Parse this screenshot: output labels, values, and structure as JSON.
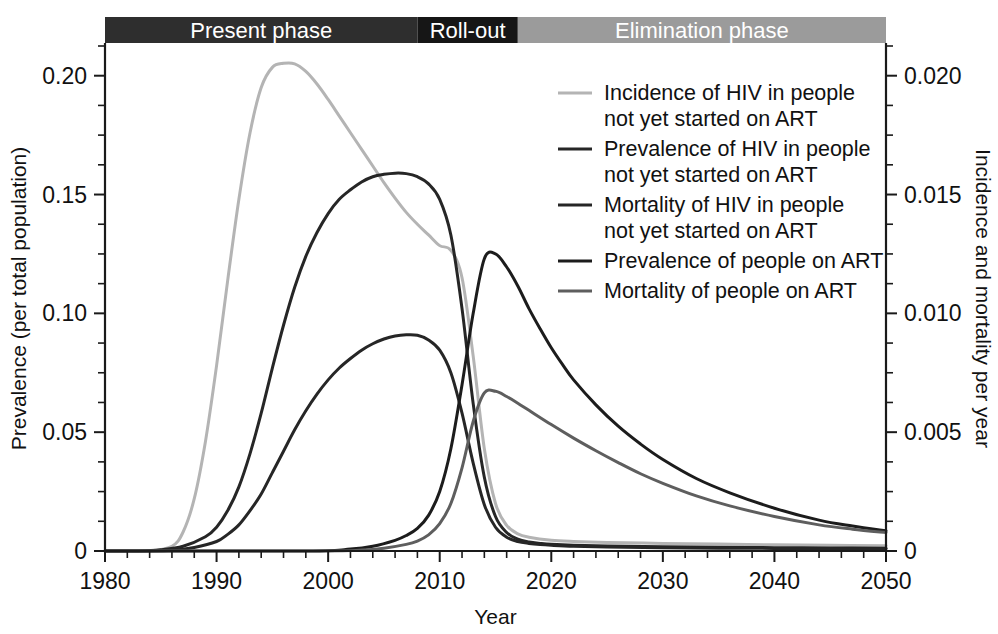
{
  "chart_data": {
    "type": "line",
    "title": "",
    "xlabel": "Year",
    "ylabel": "Prevalence (per total population)",
    "y2label": "Incidence and mortality per year",
    "xlim": [
      1980,
      2050
    ],
    "ylim": [
      0,
      0.2125
    ],
    "y2lim": [
      0,
      0.02125
    ],
    "grid": false,
    "legend_position": "inside-upper-right",
    "x_ticks": [
      "1980",
      "1990",
      "2000",
      "2010",
      "2020",
      "2030",
      "2040",
      "2050"
    ],
    "x_tick_values": [
      1980,
      1990,
      2000,
      2010,
      2020,
      2030,
      2040,
      2050
    ],
    "x_minor_step": 2,
    "y_ticks": [
      "0",
      "0.05",
      "0.10",
      "0.15",
      "0.20"
    ],
    "y_tick_values": [
      0,
      0.05,
      0.1,
      0.15,
      0.2
    ],
    "y_minor_step": 0.0125,
    "y2_ticks": [
      "0",
      "0.005",
      "0.010",
      "0.015",
      "0.020"
    ],
    "y2_tick_values": [
      0,
      0.005,
      0.01,
      0.015,
      0.02
    ],
    "y2_minor_step": 0.00125,
    "phase_bands": [
      {
        "label": "Present phase",
        "start": 1980,
        "end": 2008,
        "color": "#2e2e2e"
      },
      {
        "label": "Roll-out",
        "start": 2008,
        "end": 2017,
        "color": "#161616"
      },
      {
        "label": "Elimination phase",
        "start": 2017,
        "end": 2050,
        "color": "#9b9b9b"
      }
    ],
    "series": [
      {
        "name": "Incidence of HIV in people not yet started on ART",
        "legend_label_line1": "Incidence of HIV in people",
        "legend_label_line2": "not yet started on ART",
        "axis": "right",
        "color": "#b4b4b4",
        "width": 3.0,
        "x": [
          1980,
          1982,
          1984,
          1986,
          1987,
          1988,
          1989,
          1990,
          1991,
          1992,
          1993,
          1994,
          1995,
          1996,
          1997,
          1998,
          1999,
          2000,
          2001,
          2002,
          2003,
          2004,
          2005,
          2006,
          2007,
          2008,
          2009,
          2010,
          2011,
          2012,
          2013,
          2014,
          2015,
          2016,
          2017,
          2018,
          2020,
          2022,
          2025,
          2030,
          2035,
          2040,
          2045,
          2050
        ],
        "y_left_scale": [
          0.0,
          0.0,
          0.0,
          0.002,
          0.008,
          0.022,
          0.046,
          0.078,
          0.114,
          0.148,
          0.176,
          0.195,
          0.2035,
          0.2052,
          0.205,
          0.2018,
          0.1965,
          0.19,
          0.183,
          0.176,
          0.169,
          0.162,
          0.155,
          0.1485,
          0.1425,
          0.1375,
          0.133,
          0.1285,
          0.1265,
          0.115,
          0.082,
          0.043,
          0.02,
          0.0108,
          0.0072,
          0.0058,
          0.0045,
          0.004,
          0.0036,
          0.0032,
          0.0029,
          0.0026,
          0.0024,
          0.0022
        ]
      },
      {
        "name": "Prevalence of HIV in people not yet started on ART",
        "legend_label_line1": "Prevalence of HIV in people",
        "legend_label_line2": "not yet started on ART",
        "axis": "left",
        "color": "#262626",
        "width": 3.0,
        "x": [
          1980,
          1983,
          1985,
          1987,
          1989,
          1990,
          1991,
          1992,
          1993,
          1994,
          1995,
          1996,
          1997,
          1998,
          1999,
          2000,
          2001,
          2002,
          2003,
          2004,
          2005,
          2006,
          2007,
          2008,
          2009,
          2010,
          2011,
          2012,
          2013,
          2014,
          2015,
          2016,
          2017,
          2018,
          2019,
          2020,
          2022,
          2025,
          2030,
          2035,
          2040,
          2045,
          2050
        ],
        "y_left_scale": [
          0.0,
          0.0,
          0.0005,
          0.002,
          0.006,
          0.01,
          0.017,
          0.027,
          0.041,
          0.058,
          0.077,
          0.095,
          0.111,
          0.124,
          0.134,
          0.142,
          0.148,
          0.152,
          0.1553,
          0.1575,
          0.1585,
          0.159,
          0.1588,
          0.1575,
          0.1545,
          0.148,
          0.133,
          0.102,
          0.062,
          0.031,
          0.0145,
          0.0078,
          0.005,
          0.0038,
          0.0032,
          0.0028,
          0.0024,
          0.0021,
          0.0018,
          0.0016,
          0.0014,
          0.0013,
          0.0012
        ]
      },
      {
        "name": "Mortality of HIV in people not yet started on ART",
        "legend_label_line1": "Mortality of HIV in people",
        "legend_label_line2": "not yet started on ART",
        "axis": "right",
        "color": "#262626",
        "width": 3.0,
        "x": [
          1980,
          1984,
          1986,
          1988,
          1990,
          1991,
          1992,
          1993,
          1994,
          1995,
          1996,
          1997,
          1998,
          1999,
          2000,
          2001,
          2002,
          2003,
          2004,
          2005,
          2006,
          2007,
          2008,
          2009,
          2010,
          2011,
          2012,
          2013,
          2014,
          2015,
          2016,
          2017,
          2018,
          2019,
          2020,
          2022,
          2025,
          2030,
          2035,
          2040,
          2045,
          2050
        ],
        "y_left_scale": [
          0.0,
          0.0,
          0.0003,
          0.0015,
          0.004,
          0.007,
          0.011,
          0.017,
          0.024,
          0.033,
          0.042,
          0.051,
          0.059,
          0.066,
          0.072,
          0.077,
          0.081,
          0.0845,
          0.0872,
          0.0892,
          0.0905,
          0.091,
          0.0908,
          0.0888,
          0.0845,
          0.075,
          0.058,
          0.037,
          0.0195,
          0.01,
          0.0058,
          0.004,
          0.0032,
          0.0027,
          0.0024,
          0.002,
          0.0017,
          0.0014,
          0.0012,
          0.0011,
          0.001,
          0.0009
        ]
      },
      {
        "name": "Prevalence of people on ART",
        "legend_label_line1": "Prevalence of people on ART",
        "legend_label_line2": "",
        "axis": "left",
        "color": "#1c1c1c",
        "width": 3.0,
        "x": [
          1980,
          1998,
          2002,
          2004,
          2006,
          2007,
          2008,
          2009,
          2010,
          2011,
          2012,
          2013,
          2014,
          2015,
          2016,
          2017,
          2018,
          2019,
          2020,
          2021,
          2022,
          2024,
          2026,
          2028,
          2030,
          2033,
          2036,
          2040,
          2044,
          2047,
          2050
        ],
        "y_left_scale": [
          0.0,
          0.0,
          0.0008,
          0.002,
          0.0045,
          0.0065,
          0.0095,
          0.015,
          0.025,
          0.043,
          0.07,
          0.1,
          0.123,
          0.125,
          0.1195,
          0.1115,
          0.102,
          0.0935,
          0.0855,
          0.0785,
          0.072,
          0.0615,
          0.0525,
          0.045,
          0.0385,
          0.0305,
          0.0245,
          0.018,
          0.013,
          0.0105,
          0.0085
        ]
      },
      {
        "name": "Mortality of people on ART",
        "legend_label_line1": "Mortality of people on ART",
        "legend_label_line2": "",
        "axis": "right",
        "color": "#5e5e5e",
        "width": 3.0,
        "x": [
          1980,
          1999,
          2003,
          2005,
          2007,
          2008,
          2009,
          2010,
          2011,
          2012,
          2013,
          2014,
          2015,
          2016,
          2017,
          2018,
          2020,
          2022,
          2024,
          2026,
          2028,
          2030,
          2033,
          2036,
          2040,
          2044,
          2047,
          2050
        ],
        "y_left_scale": [
          0.0,
          0.0,
          0.0004,
          0.0012,
          0.0028,
          0.0042,
          0.0068,
          0.0115,
          0.02,
          0.035,
          0.0545,
          0.0665,
          0.0672,
          0.065,
          0.0622,
          0.0592,
          0.0532,
          0.0475,
          0.0422,
          0.0372,
          0.0325,
          0.0285,
          0.0232,
          0.019,
          0.0145,
          0.011,
          0.0092,
          0.0078
        ]
      }
    ]
  },
  "axes": {
    "left_title": "Prevalence (per total population)",
    "right_title": "Incidence and mortality per year",
    "bottom_title": "Year"
  },
  "phases": {
    "present": "Present phase",
    "rollout": "Roll-out",
    "elimination": "Elimination phase"
  },
  "legend": {
    "items": [
      {
        "l1": "Incidence of HIV in people",
        "l2": "not yet started on ART"
      },
      {
        "l1": "Prevalence of HIV in people",
        "l2": "not yet started on ART"
      },
      {
        "l1": "Mortality of HIV in people",
        "l2": "not yet started on ART"
      },
      {
        "l1": "Prevalence of people on ART",
        "l2": ""
      },
      {
        "l1": "Mortality of people on ART",
        "l2": ""
      }
    ]
  },
  "colors": {
    "incidence": "#b4b4b4",
    "prevalence_hiv": "#262626",
    "mortality_hiv": "#262626",
    "prevalence_art": "#1c1c1c",
    "mortality_art": "#5e5e5e",
    "band_present": "#2e2e2e",
    "band_rollout": "#161616",
    "band_elimination": "#9b9b9b",
    "axis": "#1a1a1a"
  }
}
